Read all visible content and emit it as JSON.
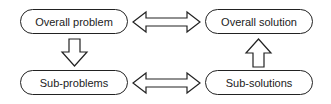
{
  "diagram": {
    "nodes": [
      {
        "id": "overall-problem",
        "label": "Overall problem"
      },
      {
        "id": "overall-solution",
        "label": "Overall solution"
      },
      {
        "id": "sub-problems",
        "label": "Sub-problems"
      },
      {
        "id": "sub-solutions",
        "label": "Sub-solutions"
      }
    ],
    "edges": [
      {
        "from": "overall-problem",
        "to": "overall-solution",
        "type": "double-arrow"
      },
      {
        "from": "overall-problem",
        "to": "sub-problems",
        "type": "arrow-down"
      },
      {
        "from": "sub-problems",
        "to": "sub-solutions",
        "type": "double-arrow"
      },
      {
        "from": "sub-solutions",
        "to": "overall-solution",
        "type": "arrow-up"
      }
    ],
    "colors": {
      "stroke": "#222222",
      "fill": "#ffffff",
      "text": "#222222"
    }
  }
}
